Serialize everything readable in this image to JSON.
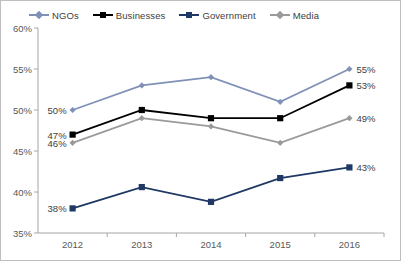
{
  "chart_data": {
    "type": "line",
    "title": "",
    "xlabel": "",
    "ylabel": "",
    "categories": [
      "2012",
      "2013",
      "2014",
      "2015",
      "2016"
    ],
    "ylim": [
      35,
      60
    ],
    "yticks": [
      "35%",
      "40%",
      "45%",
      "50%",
      "55%",
      "60%"
    ],
    "ytick_values": [
      35,
      40,
      45,
      50,
      55,
      60
    ],
    "grid": false,
    "legend_position": "top",
    "series": [
      {
        "name": "NGOs",
        "color": "#8091b8",
        "marker": "diamond",
        "values": [
          50,
          53,
          54,
          51,
          55
        ],
        "labels": {
          "first": "50%",
          "last": "55%"
        }
      },
      {
        "name": "Businesses",
        "color": "#000000",
        "marker": "square",
        "values": [
          47,
          50,
          49,
          49,
          53
        ],
        "labels": {
          "first": "47%",
          "last": "53%"
        }
      },
      {
        "name": "Government",
        "color": "#1f3864",
        "marker": "square",
        "values": [
          38,
          40.6,
          38.8,
          41.7,
          43
        ],
        "labels": {
          "first": "38%",
          "last": "43%"
        }
      },
      {
        "name": "Media",
        "color": "#9a9a9a",
        "marker": "diamond",
        "values": [
          46,
          49,
          48,
          46,
          49
        ],
        "labels": {
          "first": "46%",
          "last": "49%"
        }
      }
    ]
  },
  "axis": {
    "line_color": "#a6a6a6"
  }
}
